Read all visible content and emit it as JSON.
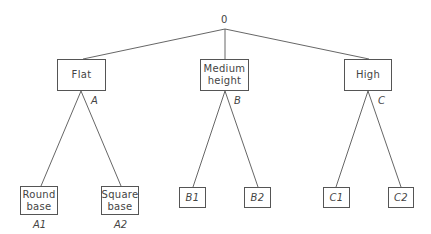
{
  "diagram": {
    "type": "tree",
    "root": {
      "label": "0"
    },
    "level1": [
      {
        "id": "A",
        "box_label": "Flat",
        "branch_label": "A"
      },
      {
        "id": "B",
        "box_label": "Medium height",
        "box_lines": [
          "Medium",
          "height"
        ],
        "branch_label": "B"
      },
      {
        "id": "C",
        "box_label": "High",
        "branch_label": "C"
      }
    ],
    "level2": [
      {
        "parent": "A",
        "box_lines": [
          "Round",
          "base"
        ],
        "label": "A1"
      },
      {
        "parent": "A",
        "box_lines": [
          "Square",
          "base"
        ],
        "label": "A2"
      },
      {
        "parent": "B",
        "box_label": "B1"
      },
      {
        "parent": "B",
        "box_label": "B2"
      },
      {
        "parent": "C",
        "box_label": "C1"
      },
      {
        "parent": "C",
        "box_label": "C2"
      }
    ]
  }
}
